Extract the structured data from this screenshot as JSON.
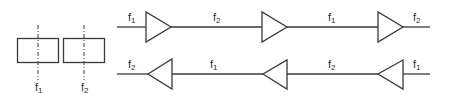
{
  "diagram": {
    "colors": {
      "stroke": "#3a3a3a",
      "text": "#2a2a2a",
      "background": "#ffffff"
    },
    "pair": {
      "blocks": [
        {
          "label": "f",
          "sub": "1"
        },
        {
          "label": "f",
          "sub": "2"
        }
      ]
    },
    "top_chain": {
      "direction": "left-to-right",
      "segments": [
        {
          "label": "f",
          "sub": "1"
        },
        {
          "label": "f",
          "sub": "2"
        },
        {
          "label": "f",
          "sub": "1"
        },
        {
          "label": "f",
          "sub": "2"
        }
      ],
      "amplifiers": 3
    },
    "bottom_chain": {
      "direction": "right-to-left",
      "segments": [
        {
          "label": "f",
          "sub": "2"
        },
        {
          "label": "f",
          "sub": "1"
        },
        {
          "label": "f",
          "sub": "2"
        },
        {
          "label": "f",
          "sub": "1"
        }
      ],
      "amplifiers": 3
    }
  }
}
